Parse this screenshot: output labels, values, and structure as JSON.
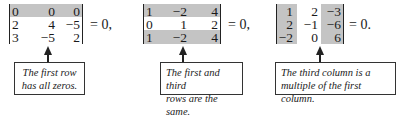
{
  "examples": [
    {
      "matrix": [
        [
          "0",
          "0",
          "0"
        ],
        [
          "2",
          "4",
          "−5"
        ],
        [
          "3",
          "−5",
          "2"
        ]
      ],
      "equation": "= 0,",
      "highlight": "first row",
      "note_line1": "The first row",
      "note_line2": "has all zeros."
    },
    {
      "matrix": [
        [
          "1",
          "−2",
          "4"
        ],
        [
          "0",
          "1",
          "2"
        ],
        [
          "1",
          "−2",
          "4"
        ]
      ],
      "equation": "= 0,",
      "highlight": "first and third rows",
      "note_line1": "The first and third",
      "note_line2": "rows are the same."
    },
    {
      "matrix": [
        [
          "1",
          "2",
          "−3"
        ],
        [
          "2",
          "−1",
          "−6"
        ],
        [
          "−2",
          "0",
          "6"
        ]
      ],
      "equation": "= 0.",
      "highlight": "first and third columns",
      "note_line1": "The third column is a",
      "note_line2": "multiple of the first column."
    }
  ],
  "colors": {
    "highlight": "#c4c4c4",
    "text": "#1a1a1a",
    "border": "#333333"
  }
}
